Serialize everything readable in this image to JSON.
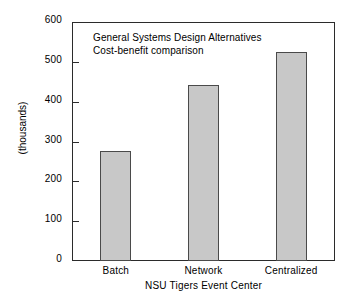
{
  "chart_data": {
    "type": "bar",
    "title": "",
    "categories": [
      "Batch",
      "Network",
      "Centralized"
    ],
    "values": [
      276,
      442,
      525
    ],
    "xlabel": "NSU Tigers Event Center",
    "ylabel": "(thousands)",
    "ylim": [
      0,
      600
    ],
    "yticks": [
      0,
      100,
      200,
      300,
      400,
      500,
      600
    ],
    "ytick_labels": [
      "0",
      "100",
      "200",
      "300",
      "400",
      "500",
      "600"
    ],
    "grid": false,
    "legend": null,
    "annotations": [
      "General Systems Design Alternatives",
      "Cost-benefit comparison"
    ],
    "colors": {
      "bar_fill": "#c8c8c8",
      "bar_edge": "#4a4a4a",
      "axis": "#2b2b2b",
      "background": "#ffffff",
      "text": "#000000"
    }
  }
}
